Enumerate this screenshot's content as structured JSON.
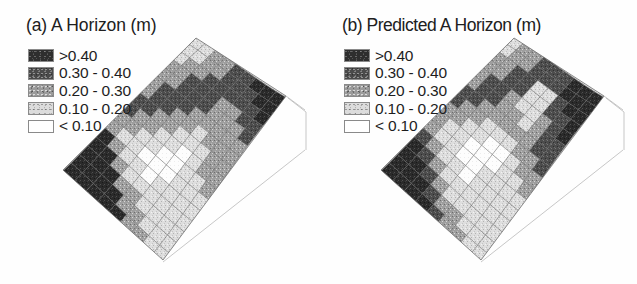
{
  "figure": {
    "type": "two-panel block diagram",
    "background": "#ffffff"
  },
  "panels": [
    {
      "id": "a",
      "title": "(a) A Horizon (m)",
      "legend": {
        "entries": [
          {
            "label": ">0.40",
            "class_index": 1,
            "color": "#2e2e2e"
          },
          {
            "label": "0.30 - 0.40",
            "class_index": 2,
            "color": "#4a4a4a"
          },
          {
            "label": "0.20 - 0.30",
            "class_index": 3,
            "color": "#9b9b9b"
          },
          {
            "label": "0.10 - 0.20",
            "class_index": 4,
            "color": "#dcdcdc"
          },
          {
            "label": "< 0.10",
            "class_index": 5,
            "color": "#ffffff"
          }
        ]
      }
    },
    {
      "id": "b",
      "title": "(b) Predicted A Horizon (m)",
      "legend": {
        "entries": [
          {
            "label": ">0.40",
            "class_index": 1,
            "color": "#2e2e2e"
          },
          {
            "label": "0.30 - 0.40",
            "class_index": 2,
            "color": "#4a4a4a"
          },
          {
            "label": "0.20 - 0.30",
            "class_index": 3,
            "color": "#9b9b9b"
          },
          {
            "label": "0.10 - 0.20",
            "class_index": 4,
            "color": "#dcdcdc"
          },
          {
            "label": "< 0.10",
            "class_index": 5,
            "color": "#ffffff"
          }
        ]
      }
    }
  ],
  "chart_data": {
    "type": "heatmap",
    "subtitle": "",
    "xlabel": "",
    "ylabel": "",
    "legend_position": "upper-left of each panel",
    "grid": true,
    "class_breaks": [
      0.1,
      0.2,
      0.3,
      0.4
    ],
    "class_labels": [
      ">0.40",
      "0.30 - 0.40",
      "0.20 - 0.30",
      "0.10 - 0.20",
      "< 0.10"
    ],
    "class_colors": [
      "#2e2e2e",
      "#4a4a4a",
      "#9b9b9b",
      "#dcdcdc",
      "#ffffff"
    ],
    "units": "m",
    "grid_rows": 16,
    "grid_cols": 9,
    "series": [
      {
        "name": "(a) A Horizon (m)",
        "description": "Measured A horizon thickness draped on terrain surface; large >0.40 m zone in lower-left footslope, mixed 0.10-0.30 m across the mid-slope mesh, darker 0.30-0.40 m band along the upper-right edge.",
        "class_grid": [
          [
            4,
            4,
            3,
            3,
            2,
            2,
            1,
            1,
            1
          ],
          [
            4,
            4,
            3,
            3,
            2,
            2,
            2,
            1,
            1
          ],
          [
            4,
            3,
            3,
            2,
            2,
            2,
            2,
            2,
            1
          ],
          [
            3,
            3,
            2,
            2,
            2,
            3,
            3,
            2,
            2
          ],
          [
            3,
            3,
            2,
            2,
            2,
            3,
            3,
            3,
            2
          ],
          [
            3,
            2,
            2,
            2,
            3,
            3,
            3,
            3,
            3
          ],
          [
            3,
            2,
            2,
            3,
            3,
            4,
            3,
            3,
            3
          ],
          [
            2,
            2,
            3,
            3,
            4,
            4,
            4,
            3,
            3
          ],
          [
            2,
            3,
            3,
            4,
            4,
            5,
            4,
            3,
            3
          ],
          [
            3,
            3,
            4,
            4,
            5,
            5,
            4,
            4,
            3
          ],
          [
            3,
            4,
            4,
            5,
            5,
            5,
            4,
            4,
            4
          ],
          [
            1,
            3,
            4,
            4,
            5,
            4,
            4,
            4,
            4
          ],
          [
            1,
            1,
            3,
            4,
            4,
            4,
            4,
            4,
            4
          ],
          [
            1,
            1,
            1,
            3,
            3,
            4,
            4,
            4,
            4
          ],
          [
            1,
            1,
            1,
            1,
            3,
            3,
            4,
            4,
            4
          ],
          [
            1,
            1,
            1,
            1,
            1,
            3,
            3,
            4,
            4
          ]
        ]
      },
      {
        "name": "(b) Predicted A Horizon (m)",
        "description": "Model-predicted A horizon thickness; smoother class boundaries, >0.40 m zone in lower-left and along the right edge, prominent <0.10 m patches through the centre of the mesh.",
        "class_grid": [
          [
            4,
            3,
            3,
            2,
            2,
            2,
            1,
            1,
            1
          ],
          [
            4,
            3,
            3,
            2,
            2,
            2,
            1,
            1,
            1
          ],
          [
            3,
            3,
            2,
            2,
            4,
            4,
            2,
            1,
            1
          ],
          [
            3,
            3,
            2,
            2,
            4,
            4,
            2,
            2,
            1
          ],
          [
            3,
            2,
            2,
            3,
            4,
            4,
            3,
            2,
            1
          ],
          [
            3,
            2,
            2,
            3,
            3,
            4,
            3,
            2,
            2
          ],
          [
            2,
            2,
            3,
            3,
            3,
            3,
            3,
            2,
            2
          ],
          [
            2,
            3,
            3,
            4,
            4,
            4,
            3,
            3,
            2
          ],
          [
            3,
            3,
            4,
            4,
            5,
            5,
            4,
            3,
            3
          ],
          [
            3,
            4,
            4,
            5,
            5,
            5,
            4,
            4,
            3
          ],
          [
            3,
            4,
            4,
            5,
            5,
            4,
            4,
            4,
            4
          ],
          [
            2,
            3,
            4,
            4,
            5,
            4,
            4,
            4,
            4
          ],
          [
            1,
            2,
            3,
            4,
            4,
            4,
            4,
            4,
            4
          ],
          [
            1,
            1,
            2,
            3,
            4,
            4,
            4,
            4,
            4
          ],
          [
            1,
            1,
            1,
            2,
            3,
            3,
            4,
            4,
            4
          ],
          [
            1,
            1,
            1,
            1,
            2,
            3,
            3,
            4,
            4
          ]
        ]
      }
    ]
  }
}
